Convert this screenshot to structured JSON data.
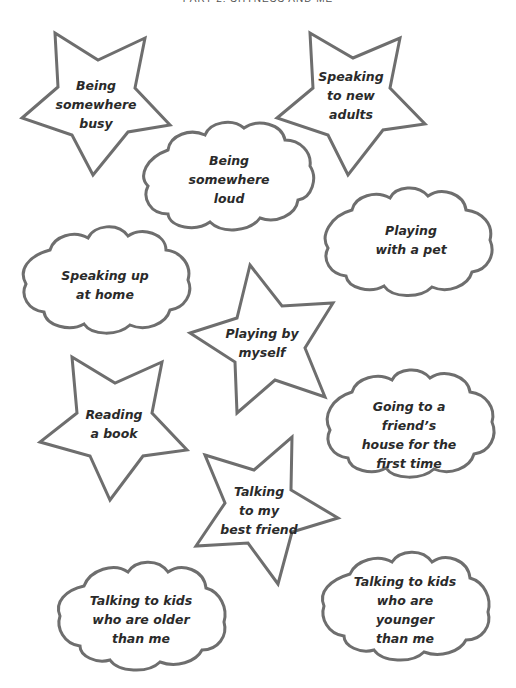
{
  "header": {
    "title": "PART 2: SHYNESS AND ME"
  },
  "style": {
    "stroke_color": "#6e6e6e",
    "text_color": "#2a2a2a",
    "background": "#ffffff"
  },
  "shapes": [
    {
      "type": "star",
      "text": "Being\nsomewhere\nbusy"
    },
    {
      "type": "star",
      "text": "Speaking\nto new\nadults"
    },
    {
      "type": "cloud",
      "text": "Being\nsomewhere\nloud"
    },
    {
      "type": "cloud",
      "text": "Playing\nwith a pet"
    },
    {
      "type": "cloud",
      "text": "Speaking up\nat home"
    },
    {
      "type": "star",
      "text": "Playing by\nmyself"
    },
    {
      "type": "star",
      "text": "Reading\na book"
    },
    {
      "type": "cloud",
      "text": "Going to a friend’s\nhouse for the\nfirst time"
    },
    {
      "type": "star",
      "text": "Talking\nto my\nbest friend"
    },
    {
      "type": "cloud",
      "text": "Talking to kids\nwho are older\nthan me"
    },
    {
      "type": "cloud",
      "text": "Talking to kids\nwho are younger\nthan me"
    }
  ]
}
